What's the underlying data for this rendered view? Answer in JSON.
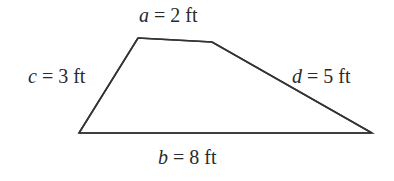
{
  "diagram": {
    "type": "trapezoid",
    "stroke_color": "#333333",
    "text_color": "#2a2a2a",
    "vertices": {
      "top_left": [
        138,
        38
      ],
      "top_right": [
        212,
        42
      ],
      "bottom_right": [
        372,
        133
      ],
      "bottom_left": [
        79,
        133
      ]
    },
    "sides": {
      "a": {
        "var": "a",
        "eq": " = 2 ft",
        "length": "2 ft",
        "position": "top"
      },
      "b": {
        "var": "b",
        "eq": " = 8 ft",
        "length": "8 ft",
        "position": "bottom"
      },
      "c": {
        "var": "c",
        "eq": " = 3 ft",
        "length": "3 ft",
        "position": "left"
      },
      "d": {
        "var": "d",
        "eq": " = 5 ft",
        "length": "5 ft",
        "position": "right"
      }
    }
  }
}
